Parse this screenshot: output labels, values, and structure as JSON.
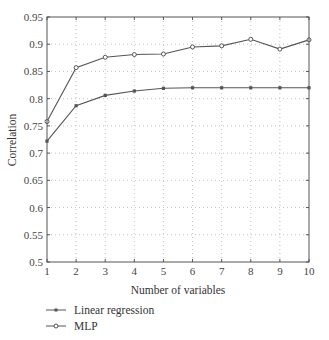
{
  "chart_data": {
    "type": "line",
    "title": "",
    "xlabel": "Number of variables",
    "ylabel": "Correlation",
    "x": [
      1,
      2,
      3,
      4,
      5,
      6,
      7,
      8,
      9,
      10
    ],
    "xlim": [
      1,
      10
    ],
    "ylim": [
      0.5,
      0.95
    ],
    "xticks": [
      "1",
      "2",
      "3",
      "4",
      "5",
      "6",
      "7",
      "8",
      "9",
      "10"
    ],
    "yticks": [
      "0.5",
      "0.55",
      "0.6",
      "0.65",
      "0.7",
      "0.75",
      "0.8",
      "0.85",
      "0.9",
      "0.95"
    ],
    "grid": true,
    "legend_position": "below",
    "series": [
      {
        "name": "Linear regression",
        "marker": "square",
        "color": "#555555",
        "values": [
          0.722,
          0.787,
          0.806,
          0.814,
          0.819,
          0.82,
          0.82,
          0.82,
          0.82,
          0.82
        ]
      },
      {
        "name": "MLP",
        "marker": "circle",
        "color": "#555555",
        "values": [
          0.758,
          0.857,
          0.876,
          0.881,
          0.882,
          0.895,
          0.897,
          0.909,
          0.891,
          0.908
        ]
      }
    ]
  },
  "legend": {
    "items": [
      "Linear regression",
      "MLP"
    ]
  }
}
